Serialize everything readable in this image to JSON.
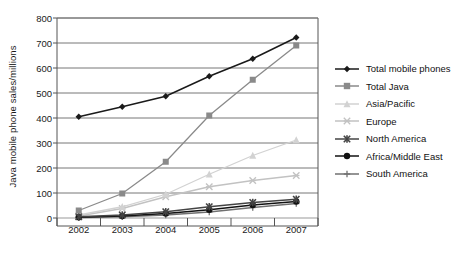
{
  "chart_data": {
    "type": "line",
    "title": "",
    "xlabel": "",
    "ylabel": "Java mobile phone sales/millions",
    "x": [
      2002,
      2003,
      2004,
      2005,
      2006,
      2007
    ],
    "categories": [
      "2002",
      "2003",
      "2004",
      "2005",
      "2006",
      "2007"
    ],
    "xtick_labels": [
      "2002",
      "2003",
      "2004",
      "2005",
      "2006",
      "2007"
    ],
    "ytick_labels": [
      "0",
      "100",
      "200",
      "300",
      "400",
      "500",
      "600",
      "700",
      "800"
    ],
    "ylim": [
      0,
      800
    ],
    "ytick_step": 100,
    "grid": true,
    "legend_position": "right",
    "series": [
      {
        "name": "Total mobile phones",
        "marker": "diamond",
        "color": "#1a1a1a",
        "values": [
          405,
          445,
          487,
          567,
          637,
          722
        ]
      },
      {
        "name": "Total Java",
        "marker": "square",
        "color": "#8a8a8a",
        "values": [
          30,
          98,
          225,
          410,
          553,
          690
        ]
      },
      {
        "name": "Asia/Pacific",
        "marker": "triangle",
        "color": "#d2d2d2",
        "values": [
          12,
          45,
          95,
          175,
          250,
          312
        ]
      },
      {
        "name": "Europe",
        "marker": "cross",
        "color": "#c2c2c2",
        "values": [
          8,
          38,
          85,
          125,
          150,
          170
        ]
      },
      {
        "name": "North America",
        "marker": "star",
        "color": "#444444",
        "values": [
          5,
          12,
          25,
          45,
          62,
          75
        ]
      },
      {
        "name": "Africa/Middle East",
        "marker": "circle",
        "color": "#121212",
        "values": [
          3,
          8,
          18,
          33,
          52,
          66
        ]
      },
      {
        "name": "South America",
        "marker": "plus",
        "color": "#707070",
        "values": [
          2,
          5,
          12,
          24,
          42,
          58
        ]
      }
    ]
  },
  "axis": {
    "y_title": "Java mobile phone sales/millions"
  }
}
